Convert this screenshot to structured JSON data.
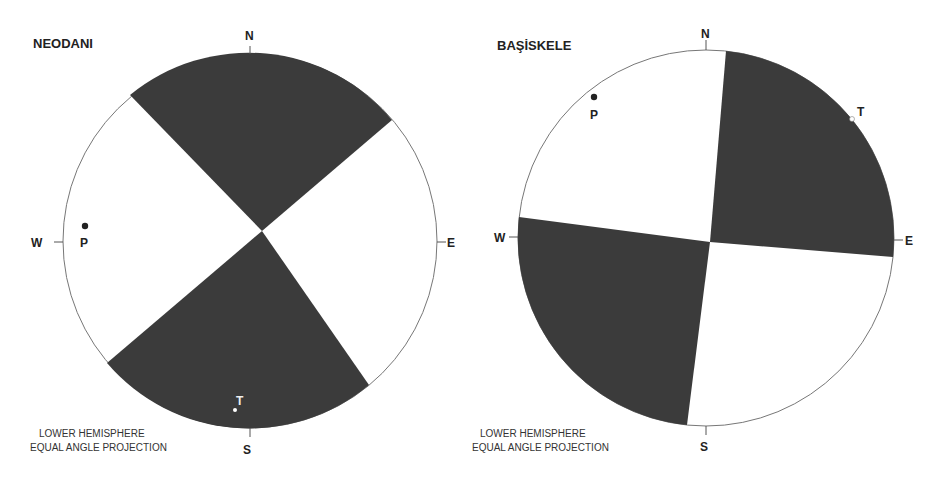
{
  "colors": {
    "compression": "#3b3b3b",
    "dilatation": "#ffffff",
    "outline": "#777777",
    "text": "#222222"
  },
  "diagrams": [
    {
      "title": "NEODANI",
      "directions": {
        "n": "N",
        "s": "S",
        "e": "E",
        "w": "W"
      },
      "p_axis": {
        "label": "P",
        "x": 85,
        "y": 226
      },
      "t_axis": {
        "label": "T",
        "x": 235,
        "y": 410
      },
      "note_line1": "LOWER HEMISPHERE",
      "note_line2": "EQUAL ANGLE PROJECTION"
    },
    {
      "title": "BAŞİSKELE",
      "directions": {
        "n": "N",
        "s": "S",
        "e": "E",
        "w": "W"
      },
      "p_axis": {
        "label": "P",
        "x": 594,
        "y": 97
      },
      "t_axis": {
        "label": "T",
        "x": 852,
        "y": 119
      },
      "note_line1": "LOWER HEMISPHERE",
      "note_line2": "EQUAL ANGLE PROJECTION"
    }
  ]
}
